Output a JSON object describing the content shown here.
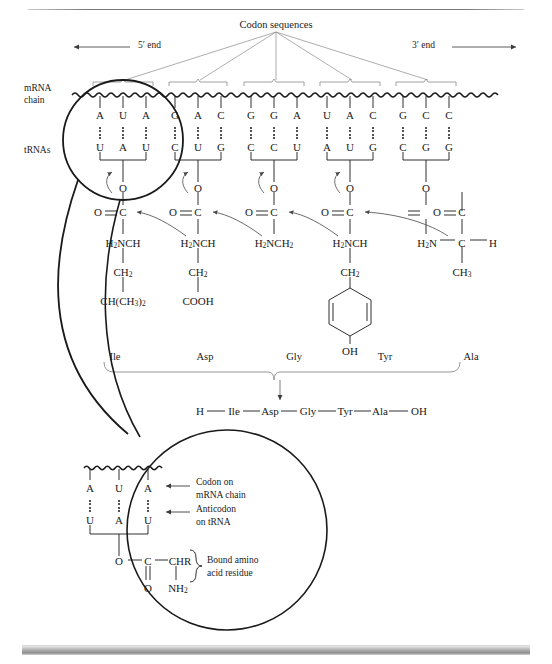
{
  "figure": {
    "title_label": "Codon sequences",
    "five_prime": "5′ end",
    "three_prime": "3′ end",
    "mrna_label_line1": "mRNA",
    "mrna_label_line2": "chain",
    "trna_label": "tRNAs"
  },
  "codons": [
    {
      "mrna": [
        "A",
        "U",
        "A"
      ],
      "anticodon": [
        "U",
        "A",
        "U"
      ],
      "amino_acid": "Ile",
      "side_chain": [
        "CH2",
        "CH(CH3)2"
      ],
      "amine": "H2NCH"
    },
    {
      "mrna": [
        "G",
        "A",
        "C"
      ],
      "anticodon": [
        "C",
        "U",
        "G"
      ],
      "amino_acid": "Asp",
      "side_chain": [
        "CH2",
        "COOH"
      ],
      "amine": "H2NCH"
    },
    {
      "mrna": [
        "G",
        "G",
        "A"
      ],
      "anticodon": [
        "C",
        "C",
        "U"
      ],
      "amino_acid": "Gly",
      "side_chain": [],
      "amine": "H2NCH2"
    },
    {
      "mrna": [
        "U",
        "A",
        "C"
      ],
      "anticodon": [
        "A",
        "U",
        "G"
      ],
      "amino_acid": "Tyr",
      "side_chain": [
        "CH2",
        "phenol-ring",
        "OH"
      ],
      "amine": "H2NCH"
    },
    {
      "mrna": [
        "G",
        "C",
        "C"
      ],
      "anticodon": [
        "C",
        "G",
        "G"
      ],
      "amino_acid": "Ala",
      "side_chain": [
        "CH3"
      ],
      "amine": "H2N",
      "alpha": "C",
      "alpha_h": "H"
    }
  ],
  "carbonyl": {
    "o_left": "O",
    "c": "C",
    "o_single": "O"
  },
  "peptide": {
    "n_terminus": "H",
    "residues": [
      "Ile",
      "Asp",
      "Gly",
      "Tyr",
      "Ala"
    ],
    "c_terminus": "OH"
  },
  "inset": {
    "mrna_bases": [
      "A",
      "U",
      "A"
    ],
    "trna_bases": [
      "U",
      "A",
      "U"
    ],
    "callout_codon_line1": "Codon on",
    "callout_codon_line2": "mRNA chain",
    "callout_anticodon_line1": "Anticodon",
    "callout_anticodon_line2": "on tRNA",
    "ester_o": "O",
    "ester_c": "C",
    "chr": "CHR",
    "carbonyl_o": "O",
    "nh2": "NH2",
    "brace_line1": "Bound amino",
    "brace_line2": "acid residue"
  },
  "colors": {
    "ink": "#1a1a1a",
    "thin_line": "#6f6f6f",
    "bar": "#9a9a9a"
  }
}
